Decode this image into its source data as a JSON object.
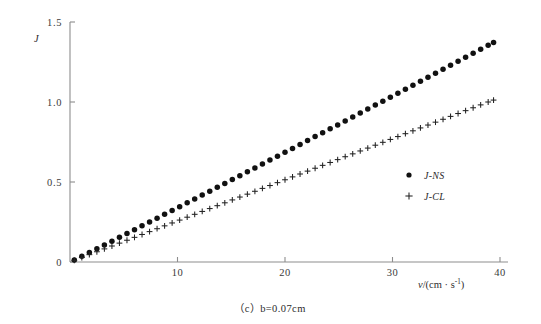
{
  "figure": {
    "caption": "（c）b=0.07cm",
    "background_color": "#ffffff",
    "axis_color": "#8d8d8d",
    "marker_color": "#111111"
  },
  "axes": {
    "y_label": "J",
    "x_label_prefix": "v",
    "x_label_unit_open": "/(cm · s",
    "x_label_unit_exp": "-1",
    "x_label_unit_close": ")",
    "x_ticklabels": [
      "10",
      "20",
      "30",
      "40"
    ],
    "y_ticklabels": [
      "0",
      "0.5",
      "1.0",
      "1.5"
    ]
  },
  "legend": {
    "position": "right-middle",
    "entries": [
      {
        "marker": "filled-circle",
        "label": "J-NS"
      },
      {
        "marker": "plus",
        "label": "J-CL"
      }
    ]
  },
  "chart_data": {
    "type": "scatter",
    "title": "",
    "subtitle": "（c）b=0.07cm",
    "xlabel": "v/(cm · s-1)",
    "ylabel": "J",
    "xlim": [
      0,
      40
    ],
    "ylim": [
      0,
      1.5
    ],
    "xticks": [
      10,
      20,
      30,
      40
    ],
    "yticks": [
      0,
      0.5,
      1.0,
      1.5
    ],
    "grid": false,
    "legend_position": "right-middle",
    "series": [
      {
        "name": "J-NS",
        "marker": "filled-circle",
        "color": "#111111",
        "x": [
          0.4,
          1.1,
          1.8,
          2.5,
          3.2,
          3.9,
          4.6,
          5.3,
          6.0,
          6.7,
          7.4,
          8.1,
          8.8,
          9.5,
          10.2,
          10.9,
          11.6,
          12.3,
          13.0,
          13.7,
          14.4,
          15.1,
          15.8,
          16.5,
          17.2,
          17.9,
          18.6,
          19.3,
          20.0,
          20.7,
          21.4,
          22.1,
          22.8,
          23.5,
          24.2,
          24.9,
          25.6,
          26.3,
          27.0,
          27.7,
          28.4,
          29.1,
          29.8,
          30.5,
          31.2,
          31.9,
          32.6,
          33.3,
          34.0,
          34.7,
          35.4,
          36.1,
          36.8,
          37.5,
          38.2,
          38.9,
          39.4
        ],
        "y": [
          0.013,
          0.036,
          0.06,
          0.083,
          0.107,
          0.13,
          0.154,
          0.178,
          0.202,
          0.226,
          0.25,
          0.274,
          0.298,
          0.322,
          0.346,
          0.37,
          0.394,
          0.418,
          0.442,
          0.467,
          0.491,
          0.515,
          0.539,
          0.564,
          0.588,
          0.612,
          0.637,
          0.661,
          0.686,
          0.71,
          0.735,
          0.759,
          0.784,
          0.808,
          0.833,
          0.857,
          0.882,
          0.907,
          0.931,
          0.956,
          0.981,
          1.005,
          1.03,
          1.055,
          1.08,
          1.104,
          1.129,
          1.154,
          1.179,
          1.204,
          1.229,
          1.254,
          1.279,
          1.304,
          1.329,
          1.354,
          1.372
        ]
      },
      {
        "name": "J-CL",
        "marker": "plus",
        "color": "#222222",
        "x": [
          0.4,
          1.1,
          1.8,
          2.5,
          3.2,
          3.9,
          4.6,
          5.3,
          6.0,
          6.7,
          7.4,
          8.1,
          8.8,
          9.5,
          10.2,
          10.9,
          11.6,
          12.3,
          13.0,
          13.7,
          14.4,
          15.1,
          15.8,
          16.5,
          17.2,
          17.9,
          18.6,
          19.3,
          20.0,
          20.7,
          21.4,
          22.1,
          22.8,
          23.5,
          24.2,
          24.9,
          25.6,
          26.3,
          27.0,
          27.7,
          28.4,
          29.1,
          29.8,
          30.5,
          31.2,
          31.9,
          32.6,
          33.3,
          34.0,
          34.7,
          35.4,
          36.1,
          36.8,
          37.5,
          38.2,
          38.9,
          39.4
        ],
        "y": [
          0.01,
          0.028,
          0.046,
          0.064,
          0.082,
          0.1,
          0.118,
          0.136,
          0.154,
          0.172,
          0.19,
          0.208,
          0.226,
          0.244,
          0.262,
          0.28,
          0.298,
          0.316,
          0.334,
          0.352,
          0.37,
          0.388,
          0.406,
          0.424,
          0.442,
          0.46,
          0.478,
          0.496,
          0.514,
          0.532,
          0.55,
          0.568,
          0.586,
          0.604,
          0.622,
          0.64,
          0.658,
          0.676,
          0.694,
          0.712,
          0.73,
          0.748,
          0.766,
          0.784,
          0.802,
          0.82,
          0.838,
          0.856,
          0.874,
          0.892,
          0.91,
          0.928,
          0.946,
          0.964,
          0.982,
          1.0,
          1.012
        ]
      }
    ]
  }
}
